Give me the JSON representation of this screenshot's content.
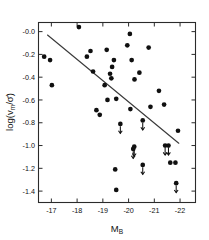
{
  "chart_data": {
    "type": "scatter",
    "title": "",
    "xlabel": "M_B",
    "xlabel_main": "M",
    "xlabel_sub": "B",
    "ylabel": "log( v_m / sigma-bar )",
    "ylabel_parts": {
      "prefix": "log(",
      "numerator": "v",
      "numerator_sub": "m",
      "slash": "/",
      "denominator": "σ̄",
      "suffix": ")"
    },
    "xlim": [
      -16.5,
      -22.6
    ],
    "ylim": [
      -1.5,
      0.08
    ],
    "xticks": [
      -17,
      -18,
      -19,
      -20,
      -21,
      -22
    ],
    "xtick_labels": [
      "-17",
      "-18",
      "-19",
      "-20",
      "-21",
      "-22"
    ],
    "yticks": [
      0.0,
      -0.2,
      -0.4,
      -0.6,
      -0.8,
      -1.0,
      -1.2,
      -1.4
    ],
    "ytick_labels": [
      "-0.0",
      "-0.2",
      "-0.4",
      "-0.6",
      "-0.8",
      "-1.0",
      "-1.2",
      "-1.4"
    ],
    "grid": false,
    "legend": false,
    "marker_color": "#101010",
    "line_color": "#3a3a3a",
    "axis_color": "#2b2b2b",
    "fit_line": {
      "label": "regression line",
      "x_start": -16.85,
      "y_start": -0.03,
      "x_end": -21.95,
      "y_end": -0.98
    },
    "series": [
      {
        "name": "detections",
        "marker": "filled-circle",
        "points": [
          {
            "x": -18.07,
            "y": 0.04
          },
          {
            "x": -20.05,
            "y": -0.02
          },
          {
            "x": -16.72,
            "y": -0.22
          },
          {
            "x": -18.52,
            "y": -0.17
          },
          {
            "x": -19.15,
            "y": -0.16
          },
          {
            "x": -19.95,
            "y": -0.12
          },
          {
            "x": -20.78,
            "y": -0.14
          },
          {
            "x": -16.95,
            "y": -0.25
          },
          {
            "x": -18.38,
            "y": -0.22
          },
          {
            "x": -19.43,
            "y": -0.25
          },
          {
            "x": -20.12,
            "y": -0.25
          },
          {
            "x": -19.36,
            "y": -0.31
          },
          {
            "x": -18.62,
            "y": -0.35
          },
          {
            "x": -19.28,
            "y": -0.37
          },
          {
            "x": -20.42,
            "y": -0.36
          },
          {
            "x": -19.33,
            "y": -0.41
          },
          {
            "x": -17.02,
            "y": -0.47
          },
          {
            "x": -19.07,
            "y": -0.47
          },
          {
            "x": -20.23,
            "y": -0.42
          },
          {
            "x": -21.18,
            "y": -0.52
          },
          {
            "x": -19.18,
            "y": -0.6
          },
          {
            "x": -19.52,
            "y": -0.59
          },
          {
            "x": -20.85,
            "y": -0.66
          },
          {
            "x": -21.38,
            "y": -0.64
          },
          {
            "x": -18.88,
            "y": -0.73
          },
          {
            "x": -18.75,
            "y": -0.69
          },
          {
            "x": -20.07,
            "y": -0.68
          },
          {
            "x": -21.92,
            "y": -0.87
          },
          {
            "x": -21.62,
            "y": -1.15
          },
          {
            "x": -21.82,
            "y": -1.15
          },
          {
            "x": -19.48,
            "y": -1.21
          },
          {
            "x": -19.52,
            "y": -1.39
          }
        ]
      },
      {
        "name": "upper-limits",
        "marker": "filled-circle-with-down-arrow",
        "points": [
          {
            "x": -19.68,
            "y": -0.81
          },
          {
            "x": -20.55,
            "y": -0.78
          },
          {
            "x": -20.22,
            "y": -1.01
          },
          {
            "x": -21.42,
            "y": -1.0
          },
          {
            "x": -21.55,
            "y": -1.0
          },
          {
            "x": -20.18,
            "y": -1.03
          },
          {
            "x": -20.55,
            "y": -1.17
          },
          {
            "x": -21.85,
            "y": -1.33
          }
        ]
      }
    ]
  },
  "figure": {
    "name": "scatter-plot-vm-sigma-vs-MB",
    "background": "#ffffff"
  }
}
